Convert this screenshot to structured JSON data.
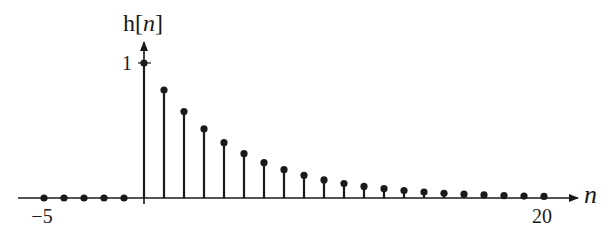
{
  "chart_data": {
    "type": "stem",
    "title": "h[n]",
    "ylabel": "h[n]",
    "xlabel": "n",
    "x_ticks": [
      {
        "value": -5,
        "label": "−5"
      },
      {
        "value": 20,
        "label": "20"
      }
    ],
    "y_ticks": [
      {
        "value": 1,
        "label": "1"
      }
    ],
    "xlim": [
      -6.3,
      21.7
    ],
    "ylim": [
      0,
      1.15
    ],
    "grid": false,
    "legend": null,
    "formula_implied": "h[n] = 0.8^n u[n]",
    "x": [
      -5,
      -4,
      -3,
      -2,
      -1,
      0,
      1,
      2,
      3,
      4,
      5,
      6,
      7,
      8,
      9,
      10,
      11,
      12,
      13,
      14,
      15,
      16,
      17,
      18,
      19,
      20
    ],
    "values": [
      0,
      0,
      0,
      0,
      0,
      1.0,
      0.8,
      0.64,
      0.512,
      0.41,
      0.328,
      0.262,
      0.21,
      0.168,
      0.134,
      0.107,
      0.086,
      0.069,
      0.055,
      0.044,
      0.035,
      0.028,
      0.023,
      0.018,
      0.014,
      0.012
    ]
  },
  "labels": {
    "y_axis_title_main": "h[",
    "y_axis_title_var": "n",
    "y_axis_title_close": "]",
    "x_axis_var": "n",
    "x_tick_min": "−5",
    "x_tick_max": "20",
    "y_tick_one": "1"
  },
  "style": {
    "ink": "#1a1a1a",
    "background": "#ffffff"
  }
}
